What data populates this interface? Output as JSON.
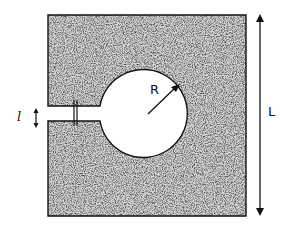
{
  "diagram": {
    "type": "geometry-figure",
    "labels": {
      "radius": "R",
      "side_length": "L",
      "slot_width": "l"
    },
    "colors": {
      "fill": "#5a5a5a",
      "stroke": "#111111",
      "background": "#ffffff"
    }
  }
}
